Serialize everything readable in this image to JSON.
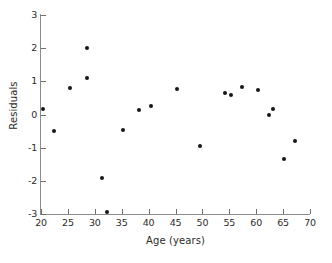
{
  "chart_data": {
    "type": "scatter",
    "title": "",
    "xlabel": "Age (years)",
    "ylabel": "Residuals",
    "xlim": [
      20,
      70
    ],
    "ylim": [
      -3,
      3
    ],
    "xticks": [
      20,
      25,
      30,
      35,
      40,
      45,
      50,
      55,
      60,
      65,
      70
    ],
    "xtick_labels": [
      "20",
      "25",
      "30",
      "35",
      "40",
      "45",
      "50",
      "55",
      "60",
      "65",
      "70"
    ],
    "yticks": [
      -3,
      -2,
      -1,
      0,
      1,
      2,
      3
    ],
    "ytick_labels": [
      "-3",
      "-2",
      "-1",
      "0",
      "1",
      "2",
      "3"
    ],
    "minor_xticks": true,
    "grid": false,
    "legend": null,
    "marker": "filled-circle",
    "marker_color": "#161616",
    "x": [
      20.4,
      22.5,
      25.4,
      28.5,
      28.6,
      31.3,
      32.3,
      35.3,
      38.2,
      40.5,
      45.3,
      49.5,
      54.2,
      55.3,
      57.4,
      60.4,
      62.3,
      63.2,
      65.2,
      67.2
    ],
    "y": [
      0.18,
      -0.5,
      0.8,
      2.0,
      1.1,
      -1.9,
      -2.95,
      -0.48,
      0.13,
      0.25,
      0.77,
      -0.95,
      0.65,
      0.6,
      0.83,
      0.75,
      -0.03,
      0.17,
      -1.35,
      -0.8
    ],
    "points": [
      {
        "x": 20.4,
        "y": 0.18
      },
      {
        "x": 22.5,
        "y": -0.5
      },
      {
        "x": 25.4,
        "y": 0.8
      },
      {
        "x": 28.5,
        "y": 2.0
      },
      {
        "x": 28.6,
        "y": 1.1
      },
      {
        "x": 31.3,
        "y": -1.9
      },
      {
        "x": 32.3,
        "y": -2.95
      },
      {
        "x": 35.3,
        "y": -0.48
      },
      {
        "x": 38.2,
        "y": 0.13
      },
      {
        "x": 40.5,
        "y": 0.25
      },
      {
        "x": 45.3,
        "y": 0.77
      },
      {
        "x": 49.5,
        "y": -0.95
      },
      {
        "x": 54.2,
        "y": 0.65
      },
      {
        "x": 55.3,
        "y": 0.6
      },
      {
        "x": 57.4,
        "y": 0.83
      },
      {
        "x": 60.4,
        "y": 0.75
      },
      {
        "x": 62.3,
        "y": -0.03
      },
      {
        "x": 63.2,
        "y": 0.17
      },
      {
        "x": 65.2,
        "y": -1.35
      },
      {
        "x": 67.2,
        "y": -0.8
      }
    ]
  },
  "axis_color": "#8c8c8c",
  "text_color": "#2b2b2b"
}
